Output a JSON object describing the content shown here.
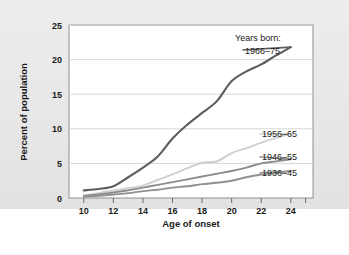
{
  "figure": {
    "background_color": "#e8e8e8",
    "plot_background_color": "#ffffff",
    "border_color": "#8f8f8f"
  },
  "axes": {
    "y_label": "Percent of population",
    "x_label": "Age of onset",
    "y_ticks": [
      "0",
      "5",
      "10",
      "15",
      "20",
      "25"
    ],
    "x_ticks": [
      "10",
      "12",
      "14",
      "16",
      "18",
      "20",
      "22",
      "24"
    ]
  },
  "legend": {
    "title": "Years born:",
    "items": [
      {
        "label": "1966–75",
        "color": "#5d5d5d"
      },
      {
        "label": "1956–65",
        "color": "#cfcfcf"
      },
      {
        "label": "1946–55",
        "color": "#8d8d8d"
      },
      {
        "label": "1936–45",
        "color": "#909090"
      }
    ]
  },
  "chart_data": {
    "type": "line",
    "title": "",
    "xlabel": "Age of onset",
    "ylabel": "Percent of population",
    "xlim": [
      9,
      25.5
    ],
    "ylim": [
      0,
      25
    ],
    "grid": true,
    "legend_position": "right-inline",
    "x": [
      10,
      11,
      12,
      13,
      14,
      15,
      16,
      17,
      18,
      19,
      20,
      21,
      22,
      23,
      24
    ],
    "series": [
      {
        "name": "1966–75",
        "color": "#5d5d5d",
        "values": [
          1.1,
          1.3,
          1.7,
          3.0,
          4.4,
          6.0,
          8.6,
          10.6,
          12.3,
          14.0,
          16.9,
          18.3,
          19.3,
          20.6,
          21.8
        ]
      },
      {
        "name": "1956–65",
        "color": "#cfcfcf",
        "values": [
          0.4,
          0.7,
          1.1,
          1.4,
          1.8,
          2.6,
          3.4,
          4.3,
          5.1,
          5.3,
          6.5,
          7.2,
          8.0,
          8.7,
          9.3
        ]
      },
      {
        "name": "1946–55",
        "color": "#8d8d8d",
        "values": [
          0.3,
          0.5,
          0.8,
          1.1,
          1.5,
          1.9,
          2.3,
          2.7,
          3.1,
          3.5,
          3.9,
          4.4,
          5.0,
          5.3,
          5.6
        ]
      },
      {
        "name": "1936–45",
        "color": "#909090",
        "values": [
          0.2,
          0.3,
          0.5,
          0.7,
          1.0,
          1.2,
          1.5,
          1.7,
          2.0,
          2.2,
          2.5,
          3.0,
          3.4,
          3.6,
          3.9
        ]
      }
    ]
  }
}
